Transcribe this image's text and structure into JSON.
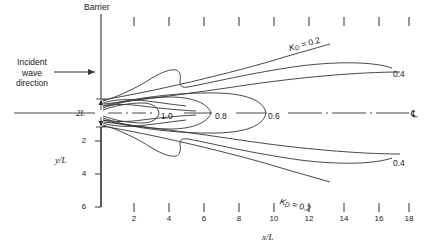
{
  "figure": {
    "title_barrier": "Barrier",
    "incident_label_lines": [
      "Incident",
      "wave",
      "direction"
    ],
    "gap_label": "2L",
    "centerline_symbol": "℄",
    "axis_x_label": "x/L",
    "axis_y_label": "y/L"
  },
  "axes": {
    "x_ticks": [
      2,
      4,
      6,
      8,
      10,
      12,
      14,
      16,
      18
    ],
    "y_ticks": [
      2,
      4,
      6
    ],
    "top_tick_count": 9
  },
  "chart_data": {
    "type": "line",
    "xlabel": "x/L",
    "ylabel": "y/L",
    "xlim": [
      0,
      19
    ],
    "ylim": [
      -6,
      6
    ],
    "grid": false,
    "legend": "inline contour labels",
    "contour_variable": "K_D",
    "contour_labels": [
      {
        "name": "kd-upper-02",
        "text": "K_D = 0.2",
        "value": 0.2,
        "position": "upper-right"
      },
      {
        "name": "kd-upper-04",
        "text": "0.4",
        "value": 0.4,
        "position": "right-upper"
      },
      {
        "name": "kd-centerline-06",
        "text": "0.6",
        "value": 0.6,
        "position": "centerline"
      },
      {
        "name": "kd-centerline-08",
        "text": "0.8",
        "value": 0.8,
        "position": "centerline"
      },
      {
        "name": "kd-centerline-10",
        "text": "1.0",
        "value": 1.0,
        "position": "centerline"
      },
      {
        "name": "kd-lower-04",
        "text": "0.4",
        "value": 0.4,
        "position": "right-lower"
      },
      {
        "name": "kd-lower-02",
        "text": "K_D = 0.2",
        "value": 0.2,
        "position": "lower-right"
      }
    ],
    "series": [
      {
        "name": "K_D = 0.2 (upper)",
        "value": 0.2,
        "note": "near-straight ray rising from gap edge to upper right"
      },
      {
        "name": "K_D = 0.4 (upper)",
        "value": 0.4,
        "note": "broad arc from gap edge to right margin"
      },
      {
        "name": "K_D = 0.6",
        "value": 0.6,
        "note": "closed lobe around centerline terminating near x/L = 9"
      },
      {
        "name": "K_D = 0.8",
        "value": 0.8,
        "note": "closed lobe around centerline terminating near x/L = 7"
      },
      {
        "name": "K_D = 1.0",
        "value": 1.0,
        "note": "closed lobe around centerline terminating near x/L = 5"
      },
      {
        "name": "K_D = 0.4 (lower)",
        "value": 0.4,
        "note": "mirror of upper 0.4 arc below centerline"
      },
      {
        "name": "K_D = 0.2 (lower)",
        "value": 0.2,
        "note": "mirror ray descending from gap edge to lower right"
      }
    ]
  }
}
